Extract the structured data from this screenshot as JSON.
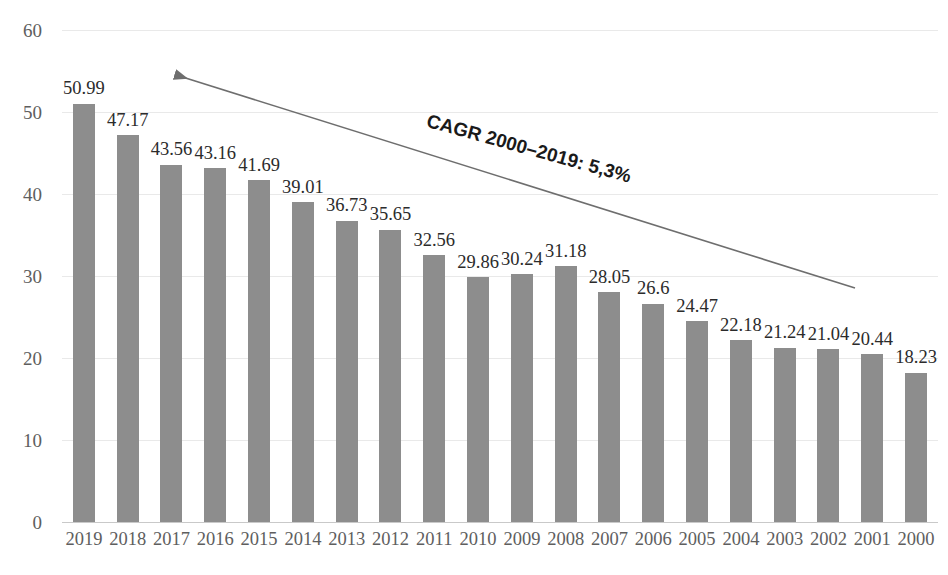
{
  "chart_data": {
    "type": "bar",
    "title": "",
    "xlabel": "",
    "ylabel": "",
    "ylim": [
      0,
      60
    ],
    "ytick_values": [
      0,
      10,
      20,
      30,
      40,
      50,
      60
    ],
    "ytick_labels": [
      "0",
      "10",
      "20",
      "30",
      "40",
      "50",
      "60"
    ],
    "grid": true,
    "legend": "none",
    "orientation": "vertical",
    "bar_color": "#8d8d8d",
    "categories": [
      "2019",
      "2018",
      "2017",
      "2016",
      "2015",
      "2014",
      "2013",
      "2012",
      "2011",
      "2010",
      "2009",
      "2008",
      "2007",
      "2006",
      "2005",
      "2004",
      "2003",
      "2002",
      "2001",
      "2000"
    ],
    "values": [
      50.99,
      47.17,
      43.56,
      43.16,
      41.69,
      39.01,
      36.73,
      35.65,
      32.56,
      29.86,
      30.24,
      31.18,
      28.05,
      26.6,
      24.47,
      22.18,
      21.24,
      21.04,
      20.44,
      18.23
    ],
    "data_labels": [
      "50.99",
      "47.17",
      "43.56",
      "43.16",
      "41.69",
      "39.01",
      "36.73",
      "35.65",
      "32.56",
      "29.86",
      "30.24",
      "31.18",
      "28.05",
      "26.6",
      "24.47",
      "22.18",
      "21.24",
      "21.04",
      "20.44",
      "18.23"
    ],
    "annotations": [
      {
        "text": "CAGR 2000–2019: 5,3%",
        "type": "arrow-label",
        "arrow_from": [
          855,
          288
        ],
        "arrow_to": [
          170,
          73
        ],
        "arrow_color": "#6e6e6e"
      }
    ]
  },
  "axis": {
    "y_tick_labels": [
      "60",
      "50",
      "40",
      "30",
      "20",
      "10",
      "0"
    ],
    "x_tick_labels": [
      "2019",
      "2018",
      "2017",
      "2016",
      "2015",
      "2014",
      "2013",
      "2012",
      "2011",
      "2010",
      "2009",
      "2008",
      "2007",
      "2006",
      "2005",
      "2004",
      "2003",
      "2002",
      "2001",
      "2000"
    ]
  },
  "annotation": {
    "cagr_text": "CAGR 2000–2019: 5,3%"
  }
}
